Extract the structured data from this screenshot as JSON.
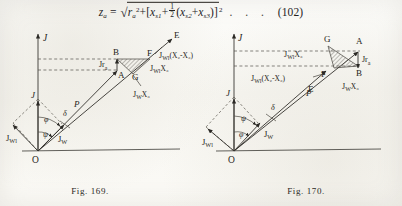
{
  "page": {
    "background_color": "#fbfaf6",
    "ink_color": "#262420"
  },
  "equation": {
    "label": "z",
    "label_sub": "a",
    "equals": "=",
    "radical": "√",
    "term1": "r",
    "term1_sub": "a",
    "term1_sup": "2",
    "plus1": "+",
    "bracket_open": "[",
    "term2": "x",
    "term2_sub": "s1",
    "plus2": "+",
    "frac_num": "1",
    "frac_den": "2",
    "paren_open": "(",
    "term3": "x",
    "term3_sub": "s2",
    "plus3": "+",
    "term4": "x",
    "term4_sub": "s3",
    "paren_close": ")",
    "bracket_close": "]",
    "bracket_sup": "2",
    "dots": ". . .",
    "number": "(102)",
    "plain_text": "z_a = √( r_a² + [ x_s1 + ½ ( x_s2 + x_s3 ) ]² )   . . .   (102)"
  },
  "figures": [
    {
      "id": "fig169",
      "caption": "Fig. 169.",
      "axis_label": "J",
      "origin_label": "O",
      "points": [
        "A",
        "B",
        "E",
        "F",
        "G"
      ],
      "vector_labels": [
        {
          "id": "p",
          "text": "P"
        },
        {
          "id": "jw-lower",
          "text": "J",
          "sub": "W"
        },
        {
          "id": "jwl-lower",
          "text": "J",
          "sub": "Wl"
        },
        {
          "id": "j-rhombus",
          "text": "J"
        },
        {
          "id": "jra",
          "text": "Jr",
          "sub": "a"
        },
        {
          "id": "jwl-x3",
          "text": "J",
          "sub": "Wl",
          "tail": "X",
          "tailsub": "3"
        },
        {
          "id": "jw-x3",
          "text": "J",
          "sub": "W",
          "tail": "X",
          "tailsub": "3"
        },
        {
          "id": "jwl-x2-x3",
          "text": "J",
          "sub": "Wl",
          "tail": "(X₂-X₃)"
        }
      ],
      "angles": [
        "φ",
        "ψ",
        "δ"
      ]
    },
    {
      "id": "fig170",
      "caption": "Fig. 170.",
      "axis_label": "J",
      "origin_label": "O",
      "points": [
        "A",
        "B",
        "E",
        "F",
        "G"
      ],
      "vector_labels": [
        {
          "id": "p",
          "text": "P"
        },
        {
          "id": "jw-lower",
          "text": "J",
          "sub": "W"
        },
        {
          "id": "jwl-lower",
          "text": "J",
          "sub": "Wl"
        },
        {
          "id": "j-rhombus",
          "text": "J"
        },
        {
          "id": "jra",
          "text": "Jr",
          "sub": "a"
        },
        {
          "id": "jwl-x3",
          "text": "J",
          "sub": "Wl",
          "tail": "X",
          "tailsub": "3"
        },
        {
          "id": "jw-x3",
          "text": "J",
          "sub": "W",
          "tail": "X",
          "tailsub": "3"
        },
        {
          "id": "jwl-x2-x3",
          "text": "J",
          "sub": "Wl",
          "tail": "(X₂-X₃)"
        }
      ],
      "angles": [
        "φ",
        "ψ",
        "δ"
      ]
    }
  ],
  "labels": {
    "J": "J",
    "O": "O",
    "A": "A",
    "B": "B",
    "E": "E",
    "F": "F",
    "G": "G",
    "P": "P",
    "phi": "φ",
    "psi": "ψ",
    "delta": "δ",
    "Jsub": "J",
    "W": "W",
    "Wl": "Wl",
    "X3": "X₃",
    "X2mX3": "(X₂-X₃)",
    "Jra_main": "Jr",
    "Jra_sub": "a"
  }
}
